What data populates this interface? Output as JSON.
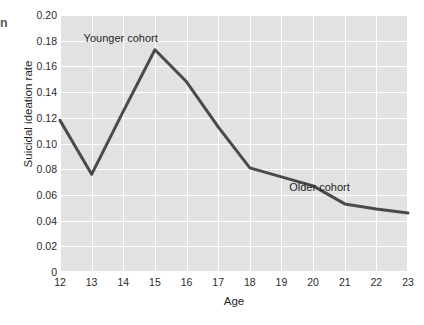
{
  "page_bleed_text": "n",
  "chart_data": {
    "type": "line",
    "title": "",
    "xlabel": "Age",
    "ylabel": "Suicidal ideation rate",
    "x": [
      12,
      13,
      14,
      15,
      16,
      17,
      18,
      19,
      20,
      21,
      22,
      23
    ],
    "xtick_labels": [
      "12",
      "13",
      "14",
      "15",
      "16",
      "17",
      "18",
      "19",
      "20",
      "21",
      "22",
      "23"
    ],
    "ytick_labels": [
      "0",
      "0.02",
      "0.04",
      "0.06",
      "0.08",
      "0.10",
      "0.12",
      "0.14",
      "0.16",
      "0.18",
      "0.20"
    ],
    "ytick_values": [
      0,
      0.02,
      0.04,
      0.06,
      0.08,
      0.1,
      0.12,
      0.14,
      0.16,
      0.18,
      0.2
    ],
    "xlim": [
      12,
      23
    ],
    "ylim": [
      0,
      0.2
    ],
    "grid": true,
    "grid_color": "#ffffff",
    "plot_background": "#e2e2e2",
    "legend": "none",
    "series": [
      {
        "name": "Suicidal ideation rate",
        "color": "#4a4a4a",
        "line_width": 3,
        "values": [
          0.118,
          0.076,
          0.125,
          0.173,
          0.148,
          0.113,
          0.081,
          0.074,
          0.067,
          0.053,
          0.049,
          0.046
        ]
      }
    ],
    "annotations": [
      {
        "text": "Younger cohort",
        "x": 14.2,
        "y": 0.182
      },
      {
        "text": "Older cohort",
        "x": 20.7,
        "y": 0.066
      }
    ]
  }
}
